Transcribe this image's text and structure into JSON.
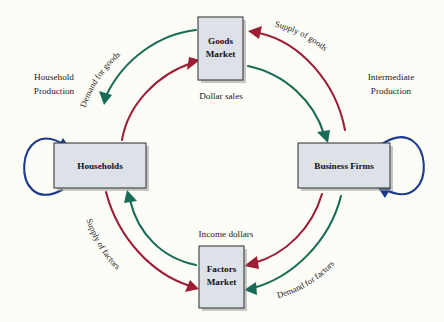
{
  "figure": {
    "type": "circular-flow-diagram",
    "background_color": "#fdfdf7",
    "title": ""
  },
  "colors": {
    "box_fill": "#dde2e8",
    "box_border": "#3b3b3b",
    "real_flow_green": "#186b56",
    "money_flow_red": "#9c1f36",
    "self_loop_blue": "#1e3a8c",
    "text": "#1a1a1a"
  },
  "nodes": [
    {
      "id": "goods-market",
      "label_line1": "Goods",
      "label_line2": "Market",
      "position": "top"
    },
    {
      "id": "households",
      "label_line1": "Households",
      "label_line2": "",
      "position": "left"
    },
    {
      "id": "business-firms",
      "label_line1": "Business Firms",
      "label_line2": "",
      "position": "right"
    },
    {
      "id": "factors-market",
      "label_line1": "Factors",
      "label_line2": "Market",
      "position": "bottom"
    }
  ],
  "node_labels": {
    "goods_market_line1": "Goods",
    "goods_market_line2": "Market",
    "households": "Households",
    "business_firms": "Business Firms",
    "factors_market_line1": "Factors",
    "factors_market_line2": "Market"
  },
  "straight_labels": {
    "household_production_line1": "Household",
    "household_production_line2": "Production",
    "intermediate_production_line1": "Intermediate",
    "intermediate_production_line2": "Production",
    "dollar_sales": "Dollar sales",
    "income_dollars": "Income dollars"
  },
  "arc_labels": {
    "demand_for_goods": "Demand for goods",
    "supply_of_goods": "Supply of goods",
    "supply_of_factors": "Supply of factors",
    "demand_for_factors": "Demand for factors"
  },
  "flows": [
    {
      "id": "demand-for-goods",
      "label": "Demand for goods",
      "color": "#186b56",
      "from": "goods-market",
      "to": "households",
      "quadrant": "top-left",
      "ring": "outer",
      "kind": "real"
    },
    {
      "id": "dollar-sales-households-to-goods",
      "label": "Dollar sales",
      "color": "#9c1f36",
      "from": "households",
      "to": "goods-market",
      "quadrant": "top-left",
      "ring": "inner",
      "kind": "money"
    },
    {
      "id": "supply-of-goods",
      "label": "Supply of goods",
      "color": "#9c1f36",
      "from": "business-firms",
      "to": "goods-market",
      "quadrant": "top-right",
      "ring": "outer",
      "kind": "money"
    },
    {
      "id": "goods-to-firms",
      "label": "Dollar sales",
      "color": "#186b56",
      "from": "goods-market",
      "to": "business-firms",
      "quadrant": "top-right",
      "ring": "inner",
      "kind": "real"
    },
    {
      "id": "supply-of-factors",
      "label": "Supply of factors",
      "color": "#9c1f36",
      "from": "households",
      "to": "factors-market",
      "quadrant": "bottom-left",
      "ring": "outer",
      "kind": "money"
    },
    {
      "id": "income-dollars-to-households",
      "label": "Income dollars",
      "color": "#186b56",
      "from": "factors-market",
      "to": "households",
      "quadrant": "bottom-left",
      "ring": "inner",
      "kind": "real"
    },
    {
      "id": "demand-for-factors",
      "label": "Demand for factors",
      "color": "#186b56",
      "from": "business-firms",
      "to": "factors-market",
      "quadrant": "bottom-right",
      "ring": "outer",
      "kind": "real"
    },
    {
      "id": "income-dollars-from-firms",
      "label": "Income dollars",
      "color": "#9c1f36",
      "from": "business-firms",
      "to": "factors-market",
      "quadrant": "bottom-right",
      "ring": "inner",
      "kind": "money"
    }
  ],
  "self_loops": [
    {
      "id": "household-production-loop",
      "label": "Household Production",
      "color": "#1e3a8c",
      "node": "households",
      "side": "left"
    },
    {
      "id": "intermediate-production-loop",
      "label": "Intermediate Production",
      "color": "#1e3a8c",
      "node": "business-firms",
      "side": "right"
    }
  ]
}
